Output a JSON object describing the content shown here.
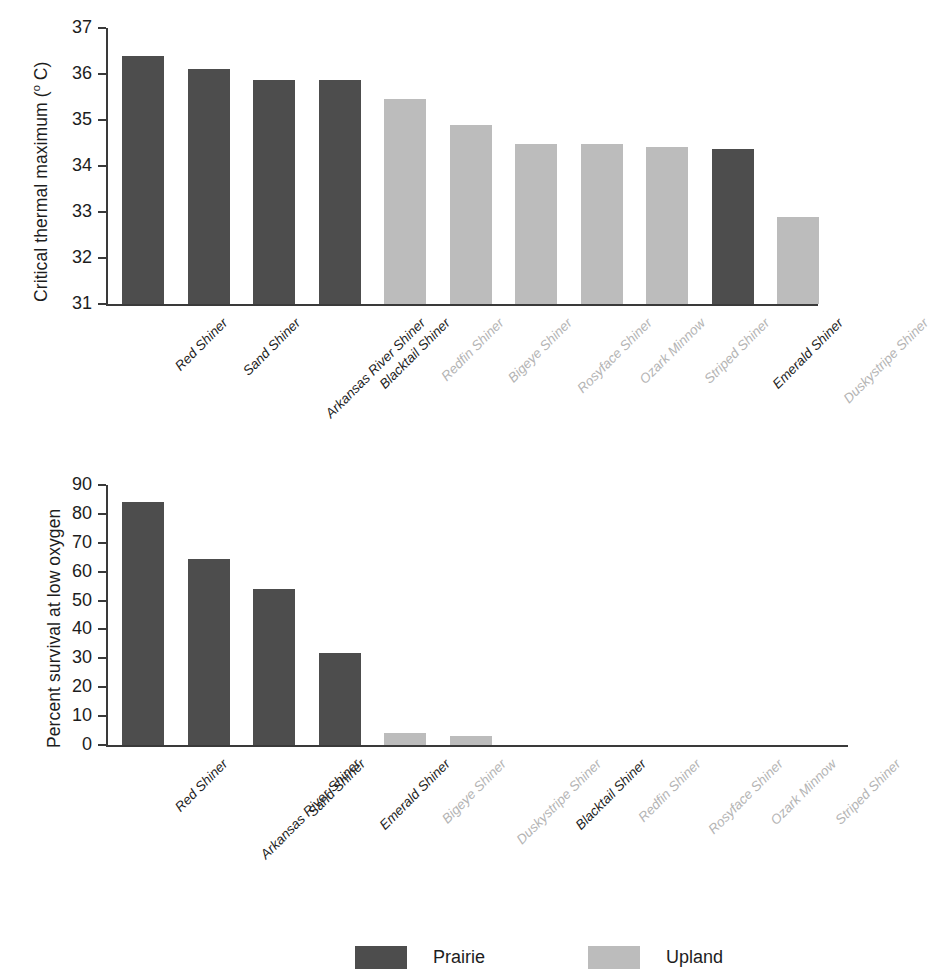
{
  "chart_data": [
    {
      "type": "bar",
      "panel": "top",
      "title": "",
      "xlabel": "",
      "ylabel": "Critical thermal maximum (o C)",
      "ylabel_text": "Critical thermal maximum (",
      "ylabel_degree": "o",
      "ylabel_suffix": " C)",
      "ylim": [
        31,
        37
      ],
      "yticks": [
        37,
        36,
        35,
        34,
        33,
        32,
        31
      ],
      "ytick_labels": [
        "37",
        "36",
        "35",
        "34",
        "33",
        "32",
        "31"
      ],
      "grid": false,
      "categories": [
        "Red Shiner",
        "Sand Shiner",
        "Arkansas River Shiner",
        "Blacktail Shiner",
        "Redfin Shiner",
        "Bigeye Shiner",
        "Rosyface Shiner",
        "Ozark Minnow",
        "Striped Shiner",
        "Emerald Shiner",
        "Duskystripe Shiner"
      ],
      "values": [
        36.4,
        36.1,
        35.87,
        35.86,
        35.45,
        34.9,
        34.48,
        34.47,
        34.42,
        34.37,
        32.9
      ],
      "groups": [
        "Prairie",
        "Prairie",
        "Prairie",
        "Prairie",
        "Upland",
        "Upland",
        "Upland",
        "Upland",
        "Upland",
        "Prairie",
        "Upland"
      ]
    },
    {
      "type": "bar",
      "panel": "bottom",
      "title": "",
      "xlabel": "",
      "ylabel": "Percent survival at low oxygen",
      "ylim": [
        0,
        90
      ],
      "yticks": [
        90,
        80,
        70,
        60,
        50,
        40,
        30,
        20,
        10,
        0
      ],
      "ytick_labels": [
        "90",
        "80",
        "70",
        "60",
        "50",
        "40",
        "30",
        "20",
        "10",
        "0"
      ],
      "grid": false,
      "categories": [
        "Red Shiner",
        "Arkansas River Shiner",
        "Sand Shiner",
        "Emerald Shiner",
        "Bigeye Shiner",
        "Duskystripe Shiner",
        "Blacktail Shiner",
        "Redfin Shiner",
        "Rosyface Shiner",
        "Ozark Minnow",
        "Striped Shiner"
      ],
      "values": [
        84,
        64.5,
        54,
        32,
        4,
        3,
        0,
        0,
        0,
        0,
        0
      ],
      "groups": [
        "Prairie",
        "Prairie",
        "Prairie",
        "Prairie",
        "Upland",
        "Upland",
        "Prairie",
        "Upland",
        "Upland",
        "Upland",
        "Upland"
      ]
    }
  ],
  "legend": {
    "position": "top-center",
    "entries": [
      {
        "label": "Prairie",
        "color": "#4d4d4d"
      },
      {
        "label": "Upland",
        "color": "#bcbcbc"
      }
    ]
  },
  "colors": {
    "prairie": "#4d4d4d",
    "upland": "#bcbcbc",
    "axis": "#3a3a3a",
    "text": "#1d1d1d",
    "text_muted": "#b4b4b4",
    "background": "#ffffff"
  }
}
